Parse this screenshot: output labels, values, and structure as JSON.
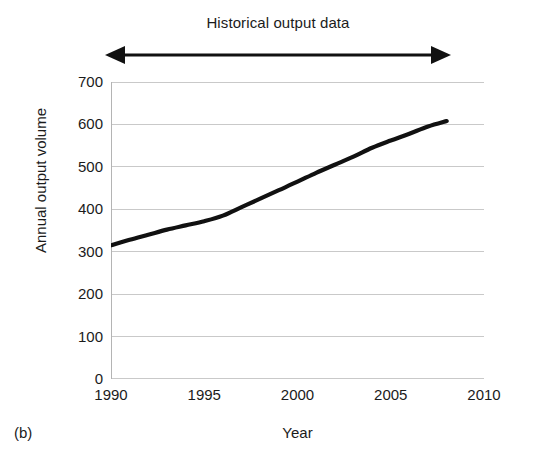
{
  "figure": {
    "panel_label": "(b)",
    "annotation": {
      "text": "Historical output data",
      "arrow_style": "double-headed",
      "arrow_start_year": 1990,
      "arrow_end_year": 2008
    }
  },
  "chart_data": {
    "type": "line",
    "title": "Historical output data",
    "xlabel": "Year",
    "ylabel": "Annual output volume",
    "xlim": [
      1990,
      2010
    ],
    "ylim": [
      0,
      700
    ],
    "xticks": [
      1990,
      1995,
      2000,
      2005,
      2010
    ],
    "yticks": [
      0,
      100,
      200,
      300,
      400,
      500,
      600,
      700
    ],
    "xtick_labels": [
      "1990",
      "1995",
      "2000",
      "2005",
      "2010"
    ],
    "ytick_labels": [
      "0",
      "100",
      "200",
      "300",
      "400",
      "500",
      "600",
      "700"
    ],
    "grid": "horizontal",
    "legend": "none",
    "line_color": "#111111",
    "grid_color": "#c9c9c9",
    "axis_color": "#b4b4b4",
    "series": [
      {
        "name": "Annual output volume",
        "x": [
          1990,
          1991,
          1992,
          1993,
          1994,
          1995,
          1996,
          1997,
          1998,
          1999,
          2000,
          2001,
          2002,
          2003,
          2004,
          2005,
          2006,
          2007,
          2008
        ],
        "values": [
          315,
          328,
          340,
          352,
          362,
          372,
          385,
          405,
          425,
          445,
          465,
          486,
          505,
          524,
          545,
          562,
          578,
          595,
          608
        ]
      }
    ]
  }
}
